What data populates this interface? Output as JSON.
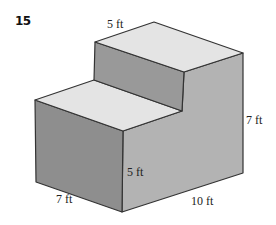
{
  "problem": {
    "number": "15"
  },
  "figure": {
    "labels": {
      "top_depth": "5 ft",
      "total_height": "7 ft",
      "lower_height": "5 ft",
      "width": "7 ft",
      "length": "10 ft"
    },
    "colors": {
      "top_face": "#e4e4e4",
      "left_face": "#8e8e8e",
      "riser_face": "#999999",
      "right_face": "#b3b3b3",
      "edge": "#333333"
    }
  }
}
